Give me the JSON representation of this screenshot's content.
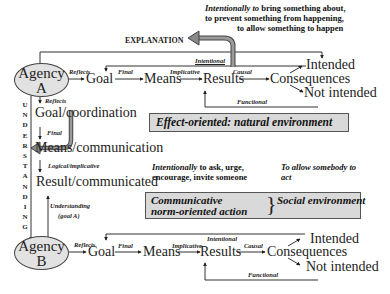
{
  "explanation_label": "EXPLANATION",
  "intention_note": {
    "lead": "Intentionally to",
    "line1_rest": " bring something about,",
    "line2": "to prevent  something from happening,",
    "line3": "to allow something to happen"
  },
  "agency_a": {
    "line1": "Agency",
    "line2": "A"
  },
  "agency_b": {
    "line1": "Agency",
    "line2": "B"
  },
  "top_chain": {
    "nodes": [
      "Goal",
      "Means",
      "Results",
      "Consequences",
      "Intended",
      "Not intended"
    ],
    "labels": {
      "reflects": "Reflects",
      "final": "Final",
      "implicative": "Implicative",
      "causal": "Causal",
      "intentional": "Intentional",
      "functional": "Functional"
    }
  },
  "effect_box": "Effect-oriented: natural environment",
  "understanding_vertical": [
    "U",
    "N",
    "D",
    "E",
    "R",
    "S",
    "T",
    "A",
    "N",
    "D",
    "I",
    "N",
    "G"
  ],
  "communication_chain": {
    "nodes": [
      "Goal/coordination",
      "Means/communication",
      "Result/communicated"
    ],
    "labels": {
      "reflects": "Reflects",
      "final": "Final",
      "logical": "Logical/implicative",
      "understanding_line1": "Understanding",
      "understanding_line2": "(goal A)"
    }
  },
  "communicative_note": {
    "lead": "Intentionally",
    "line1_rest": " to ask, urge,",
    "line2": "encourage, invite someone"
  },
  "allow_note": {
    "line1": "To allow somebody to",
    "line2": "act"
  },
  "communicative_box": {
    "line1": "Communicative",
    "line2": "norm-oriented action",
    "right": "Social environment"
  },
  "bottom_chain": {
    "nodes": [
      "Goal",
      "Means",
      "Results",
      "Consequences",
      "Intended",
      "Not intended"
    ],
    "labels": {
      "reflects": "Reflects",
      "final": "Final",
      "implicative": "Implicative",
      "causal": "Causal",
      "intentional": "Intentional",
      "functional": "Functional"
    }
  },
  "colors": {
    "box_fill": "#d9d9d9",
    "ellipse_fill": "#e2e2e2",
    "line": "#333333",
    "big_arrow": "#777777"
  }
}
